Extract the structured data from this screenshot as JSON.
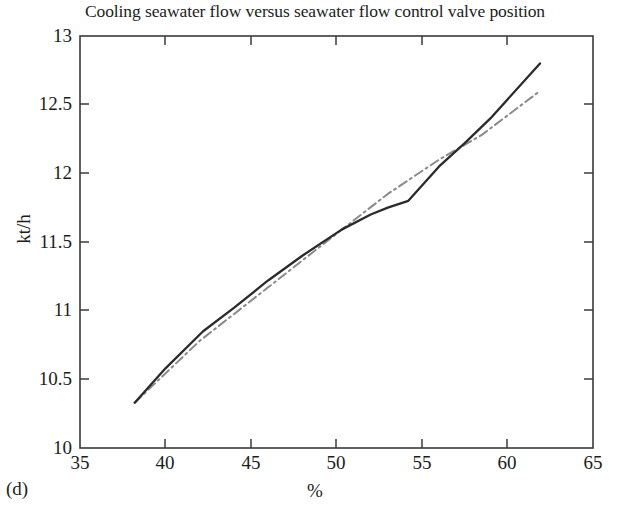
{
  "figure": {
    "caption": "(d)",
    "title": "Cooling seawater flow versus seawater flow control valve position"
  },
  "axes": {
    "x_title": "%",
    "y_title": "kt/h",
    "x_ticks": [
      "35",
      "40",
      "45",
      "50",
      "55",
      "60",
      "65"
    ],
    "y_ticks": [
      "10",
      "10.5",
      "11",
      "11.5",
      "12",
      "12.5",
      "13"
    ]
  },
  "colors": {
    "measured": "#2b2b2b",
    "model": "#8a8a8a",
    "axis": "#3a3a3a",
    "background": "#ffffff"
  },
  "chart_data": {
    "type": "line",
    "title": "Cooling seawater flow versus seawater flow control valve position",
    "subtitle": "(d)",
    "xlabel": "%",
    "ylabel": "kt/h",
    "xlim": [
      35,
      65
    ],
    "ylim": [
      10,
      13
    ],
    "xticks": [
      35,
      40,
      45,
      50,
      55,
      60,
      65
    ],
    "yticks": [
      10,
      10.5,
      11,
      11.5,
      12,
      12.5,
      13
    ],
    "grid": false,
    "legend": "none",
    "series": [
      {
        "name": "measured",
        "style": "solid",
        "color": "#2b2b2b",
        "x": [
          38.2,
          40.0,
          42.2,
          44.0,
          46.0,
          48.0,
          50.3,
          52.0,
          53.0,
          54.2,
          56.0,
          57.5,
          59.0,
          61.9
        ],
        "y": [
          10.33,
          10.58,
          10.85,
          11.02,
          11.22,
          11.4,
          11.59,
          11.7,
          11.75,
          11.8,
          12.05,
          12.22,
          12.4,
          12.8
        ]
      },
      {
        "name": "model",
        "style": "dashdot",
        "color": "#8a8a8a",
        "x": [
          38.2,
          42.0,
          46.0,
          50.0,
          53.0,
          56.0,
          58.5,
          61.9
        ],
        "y": [
          10.33,
          10.78,
          11.17,
          11.56,
          11.85,
          12.1,
          12.28,
          12.6
        ]
      }
    ]
  }
}
